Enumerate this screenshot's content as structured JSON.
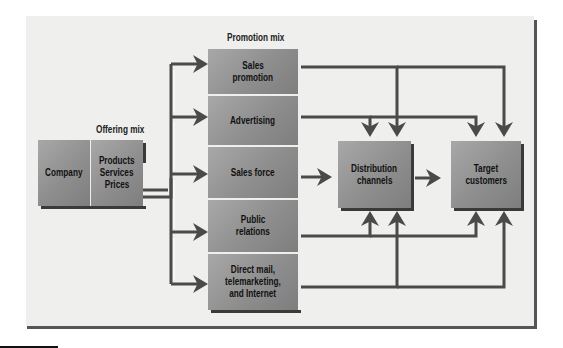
{
  "diagram": {
    "title_offering": "Offering mix",
    "title_promotion": "Promotion mix",
    "company": {
      "label": "Company"
    },
    "offering": {
      "lines": [
        "Products",
        "Services",
        "Prices"
      ]
    },
    "promotion_items": [
      {
        "line1": "Sales",
        "line2": "promotion",
        "line3": ""
      },
      {
        "line1": "Advertising",
        "line2": "",
        "line3": ""
      },
      {
        "line1": "Sales force",
        "line2": "",
        "line3": ""
      },
      {
        "line1": "Public",
        "line2": "relations",
        "line3": ""
      },
      {
        "line1": "Direct mail,",
        "line2": "telemarketing,",
        "line3": "and Internet"
      }
    ],
    "distribution": {
      "line1": "Distribution",
      "line2": "channels"
    },
    "target": {
      "line1": "Target",
      "line2": "customers"
    },
    "colors": {
      "box": "#8e8e8e",
      "arrow": "#4a4a4a",
      "background": "#efefed",
      "frame": "#555555"
    }
  }
}
